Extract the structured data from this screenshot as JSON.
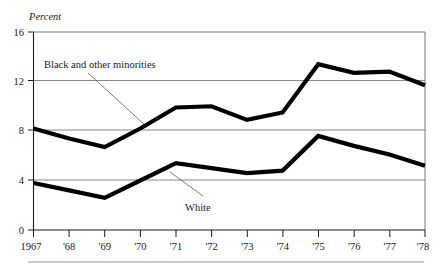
{
  "chart_data": {
    "type": "line",
    "title": "",
    "subtitle": "",
    "xlabel": "",
    "ylabel": "Percent",
    "ylim": [
      0,
      16
    ],
    "yticks": [
      0,
      4,
      8,
      12,
      16
    ],
    "ytick_labels": [
      "0",
      "4",
      "8",
      "12",
      "16"
    ],
    "grid": true,
    "grid_axis": "y",
    "legend_position": "inline-annotations",
    "x": [
      1967,
      1968,
      1969,
      1970,
      1971,
      1972,
      1973,
      1974,
      1975,
      1976,
      1977,
      1978
    ],
    "xtick_labels": [
      "1967",
      "'68",
      "'69",
      "'70",
      "'71",
      "'72",
      "'73",
      "'74",
      "'75",
      "'76",
      "'77",
      "'78"
    ],
    "series": [
      {
        "name": "Black and other minorities",
        "color": "#000000",
        "values": [
          8.2,
          7.4,
          6.7,
          8.2,
          9.9,
          10.0,
          8.9,
          9.5,
          13.4,
          12.7,
          12.8,
          11.7
        ]
      },
      {
        "name": "White",
        "color": "#000000",
        "values": [
          3.8,
          3.2,
          2.6,
          4.0,
          5.4,
          5.0,
          4.6,
          4.8,
          7.6,
          6.8,
          6.1,
          5.2
        ]
      }
    ],
    "annotations": [
      {
        "text": "Black and other minorities",
        "series": "Black and other minorities"
      },
      {
        "text": "White",
        "series": "White"
      }
    ]
  },
  "axis": {
    "unit_label": "Percent",
    "ytick_0": "0",
    "ytick_4": "4",
    "ytick_8": "8",
    "ytick_12": "12",
    "ytick_16": "16",
    "xtick_1967": "1967",
    "xtick_1968": "'68",
    "xtick_1969": "'69",
    "xtick_1970": "'70",
    "xtick_1971": "'71",
    "xtick_1972": "'72",
    "xtick_1973": "'73",
    "xtick_1974": "'74",
    "xtick_1975": "'75",
    "xtick_1976": "'76",
    "xtick_1977": "'77",
    "xtick_1978": "'78"
  },
  "labels": {
    "minorities": "Black and other minorities",
    "white": "White"
  },
  "colors": {
    "line": "#000000",
    "grid": "#555555",
    "axis": "#1a1a1a",
    "background": "#ffffff"
  }
}
